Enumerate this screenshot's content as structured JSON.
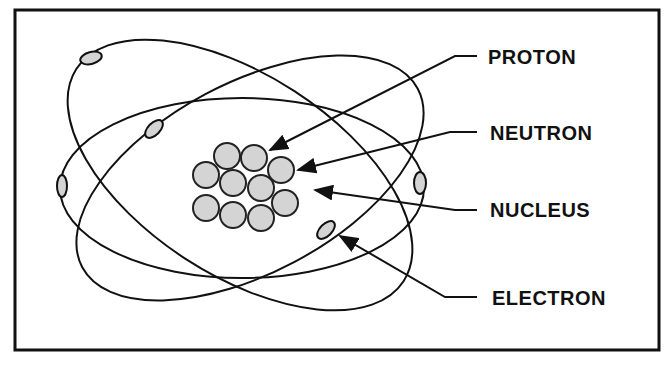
{
  "diagram": {
    "labels": {
      "proton": "PROTON",
      "neutron": "NEUTRON",
      "nucleus": "NUCLEUS",
      "electron": "ELECTRON"
    },
    "colors": {
      "stroke": "#111111",
      "particle_fill": "#d4d4d4",
      "background": "#ffffff"
    },
    "nucleus_particle_count": 11,
    "electron_count": 6,
    "orbit_count": 3
  }
}
